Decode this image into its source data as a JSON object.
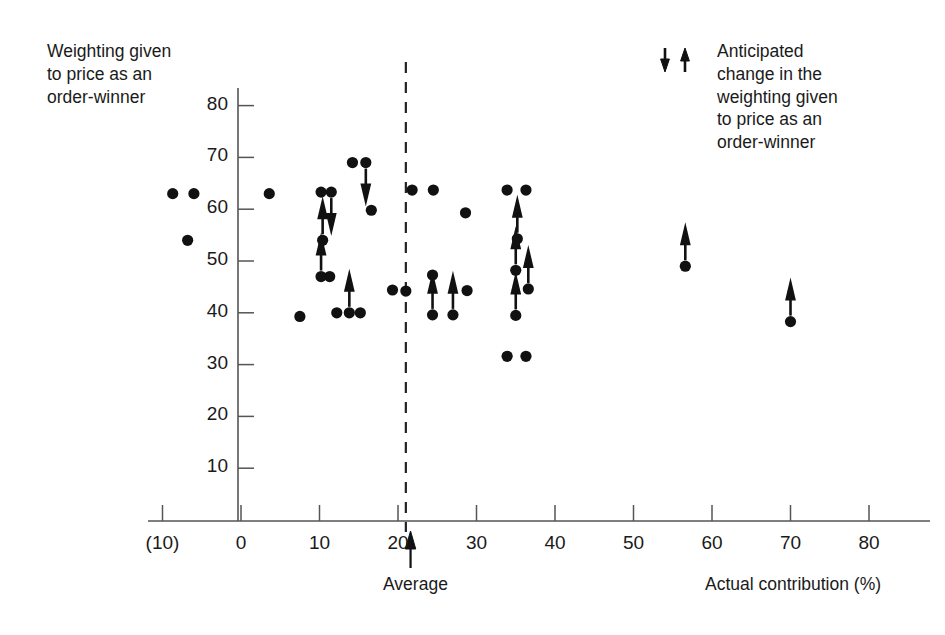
{
  "figure": {
    "y_axis_caption": "Weighting given\nto price as an\norder-winner",
    "legend_caption": "Anticipated\nchange in the\nweighting given\nto price as an\norder-winner",
    "legend_icons": [
      "down-arrow",
      "up-arrow"
    ],
    "average_label": "Average",
    "x_axis_title": "Actual contribution (%)"
  },
  "chart_data": {
    "type": "scatter",
    "title": "",
    "xlabel": "Actual contribution (%)",
    "ylabel": "Weighting given to price as an order-winner",
    "xlim": [
      -10,
      85
    ],
    "ylim": [
      0,
      85
    ],
    "grid": false,
    "legend_position": "top-right",
    "xticks": [
      -10,
      0,
      10,
      20,
      30,
      40,
      50,
      60,
      70,
      80
    ],
    "xtick_labels": [
      "(10)",
      "0",
      "10",
      "20",
      "30",
      "40",
      "50",
      "60",
      "70",
      "80"
    ],
    "yticks": [
      10,
      20,
      30,
      40,
      50,
      60,
      70,
      80
    ],
    "ytick_labels": [
      "10",
      "20",
      "30",
      "40",
      "50",
      "60",
      "70",
      "80"
    ],
    "annotations": [
      {
        "name": "average-line",
        "type": "vertical-dashed-line",
        "x": 21
      },
      {
        "name": "average-arrow",
        "type": "up-arrow-marker",
        "x": 21.6,
        "label": "Average"
      }
    ],
    "arrow_legend": {
      "down-arrow": "anticipated decrease in weighting",
      "up-arrow": "anticipated increase in weighting"
    },
    "points": [
      {
        "x": -8.7,
        "y": 63.0,
        "arrow": "none"
      },
      {
        "x": -6.0,
        "y": 63.0,
        "arrow": "none"
      },
      {
        "x": -6.8,
        "y": 54.0,
        "arrow": "none"
      },
      {
        "x": 3.6,
        "y": 63.0,
        "arrow": "none"
      },
      {
        "x": 7.5,
        "y": 39.3,
        "arrow": "none"
      },
      {
        "x": 10.2,
        "y": 63.3,
        "arrow": "none"
      },
      {
        "x": 11.5,
        "y": 63.3,
        "arrow": "down"
      },
      {
        "x": 10.4,
        "y": 54.0,
        "arrow": "up"
      },
      {
        "x": 10.2,
        "y": 47.0,
        "arrow": "up"
      },
      {
        "x": 11.3,
        "y": 47.0,
        "arrow": "none"
      },
      {
        "x": 12.2,
        "y": 40.0,
        "arrow": "none"
      },
      {
        "x": 13.8,
        "y": 40.0,
        "arrow": "up"
      },
      {
        "x": 15.2,
        "y": 40.0,
        "arrow": "none"
      },
      {
        "x": 14.2,
        "y": 69.0,
        "arrow": "none"
      },
      {
        "x": 15.9,
        "y": 69.0,
        "arrow": "down"
      },
      {
        "x": 16.6,
        "y": 59.8,
        "arrow": "none"
      },
      {
        "x": 19.3,
        "y": 44.4,
        "arrow": "none"
      },
      {
        "x": 21.0,
        "y": 44.2,
        "arrow": "none"
      },
      {
        "x": 21.8,
        "y": 63.7,
        "arrow": "none"
      },
      {
        "x": 24.5,
        "y": 63.7,
        "arrow": "none"
      },
      {
        "x": 24.4,
        "y": 47.3,
        "arrow": "none"
      },
      {
        "x": 24.4,
        "y": 39.6,
        "arrow": "up"
      },
      {
        "x": 27.0,
        "y": 39.6,
        "arrow": "up"
      },
      {
        "x": 28.6,
        "y": 59.3,
        "arrow": "none"
      },
      {
        "x": 28.8,
        "y": 44.3,
        "arrow": "none"
      },
      {
        "x": 33.9,
        "y": 63.7,
        "arrow": "none"
      },
      {
        "x": 36.3,
        "y": 63.7,
        "arrow": "none"
      },
      {
        "x": 35.2,
        "y": 54.3,
        "arrow": "up"
      },
      {
        "x": 35.0,
        "y": 48.2,
        "arrow": "up"
      },
      {
        "x": 36.6,
        "y": 44.6,
        "arrow": "up"
      },
      {
        "x": 35.0,
        "y": 39.5,
        "arrow": "up"
      },
      {
        "x": 33.9,
        "y": 31.6,
        "arrow": "none"
      },
      {
        "x": 36.3,
        "y": 31.6,
        "arrow": "none"
      },
      {
        "x": 56.6,
        "y": 49.0,
        "arrow": "up"
      },
      {
        "x": 70.0,
        "y": 38.3,
        "arrow": "up"
      }
    ]
  }
}
